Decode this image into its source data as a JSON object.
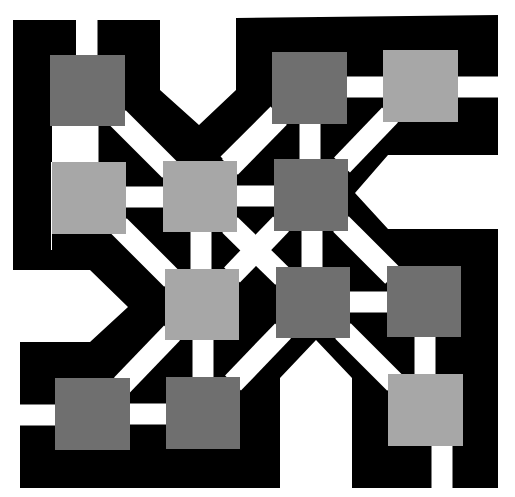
{
  "diagram": {
    "title": "",
    "background": "#ffffff",
    "frame_color": "#000000",
    "channel_color": "#ffffff",
    "colors": {
      "dark": "#6f6f6f",
      "light": "#a7a7a7"
    },
    "nodes": [
      {
        "id": "r1c1",
        "row": 1,
        "col": 1,
        "x": 50,
        "y": 55,
        "w": 75,
        "h": 71,
        "tone": "dark"
      },
      {
        "id": "r1c3",
        "row": 1,
        "col": 3,
        "x": 272,
        "y": 52,
        "w": 75,
        "h": 72,
        "tone": "dark"
      },
      {
        "id": "r1c4",
        "row": 1,
        "col": 4,
        "x": 383,
        "y": 50,
        "w": 75,
        "h": 72,
        "tone": "light"
      },
      {
        "id": "r2c1",
        "row": 2,
        "col": 1,
        "x": 52,
        "y": 162,
        "w": 74,
        "h": 72,
        "tone": "light"
      },
      {
        "id": "r2c2",
        "row": 2,
        "col": 2,
        "x": 163,
        "y": 161,
        "w": 74,
        "h": 71,
        "tone": "light"
      },
      {
        "id": "r2c3",
        "row": 2,
        "col": 3,
        "x": 274,
        "y": 159,
        "w": 74,
        "h": 72,
        "tone": "dark"
      },
      {
        "id": "r3c2",
        "row": 3,
        "col": 2,
        "x": 165,
        "y": 269,
        "w": 74,
        "h": 71,
        "tone": "light"
      },
      {
        "id": "r3c3",
        "row": 3,
        "col": 3,
        "x": 276,
        "y": 267,
        "w": 74,
        "h": 71,
        "tone": "dark"
      },
      {
        "id": "r3c4",
        "row": 3,
        "col": 4,
        "x": 387,
        "y": 266,
        "w": 74,
        "h": 71,
        "tone": "dark"
      },
      {
        "id": "r4c1",
        "row": 4,
        "col": 1,
        "x": 55,
        "y": 378,
        "w": 75,
        "h": 72,
        "tone": "dark"
      },
      {
        "id": "r4c2",
        "row": 4,
        "col": 2,
        "x": 166,
        "y": 377,
        "w": 74,
        "h": 72,
        "tone": "dark"
      },
      {
        "id": "r4c4",
        "row": 4,
        "col": 4,
        "x": 388,
        "y": 374,
        "w": 75,
        "h": 72,
        "tone": "light"
      }
    ],
    "edges": [
      {
        "from": "r1c1",
        "to": "r2c1",
        "kind": "vertical"
      },
      {
        "from": "r1c1",
        "to": "r2c2",
        "kind": "diagonal"
      },
      {
        "from": "r1c3",
        "to": "r1c4",
        "kind": "horizontal"
      },
      {
        "from": "r1c3",
        "to": "r2c3",
        "kind": "vertical"
      },
      {
        "from": "r1c3",
        "to": "r2c2",
        "kind": "diagonal"
      },
      {
        "from": "r1c4",
        "to": "r2c3",
        "kind": "diagonal"
      },
      {
        "from": "r2c1",
        "to": "r2c2",
        "kind": "horizontal"
      },
      {
        "from": "r2c2",
        "to": "r2c3",
        "kind": "horizontal"
      },
      {
        "from": "r2c2",
        "to": "r3c2",
        "kind": "vertical"
      },
      {
        "from": "r2c1",
        "to": "r3c2",
        "kind": "diagonal"
      },
      {
        "from": "r2c3",
        "to": "r3c3",
        "kind": "vertical"
      },
      {
        "from": "r2c3",
        "to": "r3c2",
        "kind": "diagonal"
      },
      {
        "from": "r2c3",
        "to": "r3c4",
        "kind": "diagonal"
      },
      {
        "from": "r2c2",
        "to": "r3c3",
        "kind": "diagonal"
      },
      {
        "from": "r3c3",
        "to": "r3c4",
        "kind": "horizontal"
      },
      {
        "from": "r3c2",
        "to": "r4c2",
        "kind": "vertical"
      },
      {
        "from": "r3c2",
        "to": "r4c1",
        "kind": "diagonal"
      },
      {
        "from": "r3c3",
        "to": "r4c2",
        "kind": "diagonal"
      },
      {
        "from": "r3c3",
        "to": "r4c4",
        "kind": "diagonal"
      },
      {
        "from": "r3c4",
        "to": "r4c4",
        "kind": "vertical"
      },
      {
        "from": "r4c1",
        "to": "r4c2",
        "kind": "horizontal"
      }
    ],
    "open_ends": [
      {
        "node": "r1c1",
        "direction": "up"
      },
      {
        "node": "r1c4",
        "direction": "right"
      },
      {
        "node": "r4c1",
        "direction": "left"
      },
      {
        "node": "r4c4",
        "direction": "down"
      }
    ]
  }
}
